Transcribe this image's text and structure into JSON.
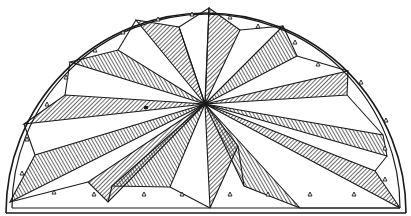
{
  "figure": {
    "colors": {
      "ink": "#1a1a1a",
      "paper": "#ffffff"
    },
    "center": [
      205,
      104
    ],
    "radius_outer": 206,
    "radius_inner": 200,
    "baseline_y": 212
  }
}
